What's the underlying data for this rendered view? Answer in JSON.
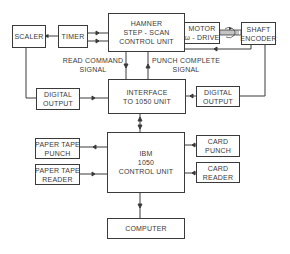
{
  "diagram": {
    "type": "block-diagram",
    "colors": {
      "line": "#3a3a3a",
      "background": "#ffffff"
    },
    "blocks": {
      "scaler": {
        "lines": [
          "SCALER"
        ]
      },
      "timer": {
        "lines": [
          "TIMER"
        ]
      },
      "hamner": {
        "lines": [
          "HAMNER",
          "STEP - SCAN",
          "CONTROL UNIT"
        ]
      },
      "motor": {
        "lines": [
          "MOTOR",
          "ω - DRIVE"
        ]
      },
      "shaft_encoder": {
        "lines": [
          "SHAFT",
          "ENCODER"
        ]
      },
      "digital_output_left": {
        "lines": [
          "DIGITAL",
          "OUTPUT"
        ]
      },
      "interface": {
        "lines": [
          "INTERFACE",
          "TO 1050 UNIT"
        ]
      },
      "digital_output_right": {
        "lines": [
          "DIGITAL",
          "OUTPUT"
        ]
      },
      "ibm": {
        "lines": [
          "IBM",
          "1050",
          "CONTROL UNIT"
        ]
      },
      "paper_tape_punch": {
        "lines": [
          "PAPER TAPE",
          "PUNCH"
        ]
      },
      "paper_tape_reader": {
        "lines": [
          "PAPER TAPE",
          "READER"
        ]
      },
      "card_punch": {
        "lines": [
          "CARD",
          "PUNCH"
        ]
      },
      "card_reader": {
        "lines": [
          "CARD",
          "READER"
        ]
      },
      "computer": {
        "lines": [
          "COMPUTER"
        ]
      }
    },
    "labels": {
      "read_command": [
        "READ COMMAND",
        "SIGNAL"
      ],
      "punch_complete": [
        "PUNCH COMPLETE",
        "SIGNAL"
      ]
    },
    "connections": [
      {
        "from": "timer",
        "to": "scaler"
      },
      {
        "from": "hamner",
        "to": "timer"
      },
      {
        "from": "hamner",
        "to": "motor"
      },
      {
        "from": "motor",
        "to": "shaft_encoder",
        "style": "mechanical-coupling"
      },
      {
        "from": "shaft_encoder",
        "to": "hamner"
      },
      {
        "from": "hamner",
        "to": "interface",
        "label": "READ COMMAND SIGNAL"
      },
      {
        "from": "interface",
        "to": "hamner",
        "label": "PUNCH COMPLETE SIGNAL"
      },
      {
        "from": "scaler",
        "to": "digital_output_left"
      },
      {
        "from": "digital_output_left",
        "to": "interface"
      },
      {
        "from": "shaft_encoder",
        "to": "digital_output_right"
      },
      {
        "from": "digital_output_right",
        "to": "interface"
      },
      {
        "from": "interface",
        "to": "ibm",
        "bidirectional": true
      },
      {
        "from": "ibm",
        "to": "paper_tape_punch"
      },
      {
        "from": "paper_tape_reader",
        "to": "ibm"
      },
      {
        "from": "card_punch",
        "to": "ibm"
      },
      {
        "from": "card_reader",
        "to": "ibm"
      },
      {
        "from": "ibm",
        "to": "computer"
      }
    ]
  }
}
